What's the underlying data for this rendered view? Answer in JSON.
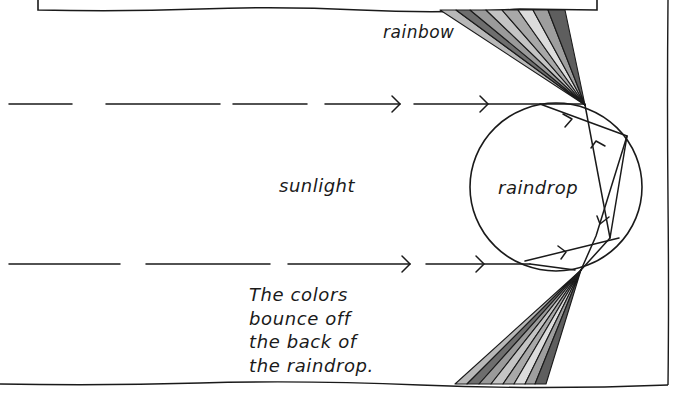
{
  "labels": {
    "rainbow": "rainbow",
    "sunlight": "sunlight",
    "raindrop": "raindrop"
  },
  "caption": {
    "lines": [
      "The colors",
      "bounce off",
      "the back of",
      "the raindrop."
    ]
  },
  "colors": {
    "ink": "#1a1a1a",
    "background": "#ffffff",
    "bands": [
      "#b8b8b8",
      "#6e6e6e",
      "#9a9a9a",
      "#c4c4c4",
      "#a8a8a8",
      "#dcdcdc",
      "#9e9e9e",
      "#5e5e5e"
    ]
  },
  "diagram": {
    "rays": [
      "top incoming sunlight ray",
      "bottom incoming sunlight ray"
    ],
    "fans": [
      "upper rainbow color fan",
      "lower rainbow color fan"
    ]
  }
}
